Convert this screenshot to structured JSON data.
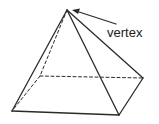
{
  "diagram": {
    "labels": [
      {
        "id": "vertex",
        "text": "vertex",
        "x": 107,
        "y": 27
      }
    ],
    "points": {
      "apex": [
        67,
        10
      ],
      "front_left": [
        12,
        111
      ],
      "front_right": [
        119,
        115
      ],
      "back_right": [
        143,
        78
      ],
      "back_left": [
        40,
        76
      ]
    },
    "colors": {
      "stroke": "#2a2a2a",
      "background": "#ffffff"
    }
  }
}
